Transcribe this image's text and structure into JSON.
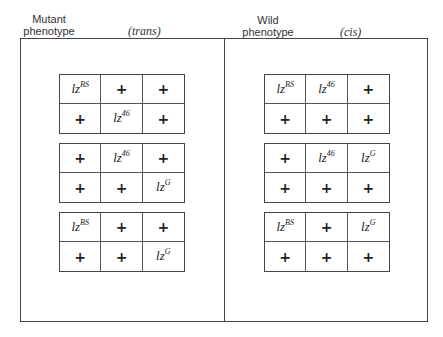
{
  "panels": [
    {
      "label_line1": "Mutant",
      "label_line2": "phenotype",
      "configuration": "(trans)",
      "grids": [
        {
          "rows": [
            [
              {
                "gene": "lz",
                "sup": "BS"
              },
              {
                "gene": "+"
              },
              {
                "gene": "+"
              }
            ],
            [
              {
                "gene": "+"
              },
              {
                "gene": "lz",
                "sup": "46"
              },
              {
                "gene": "+"
              }
            ]
          ]
        },
        {
          "rows": [
            [
              {
                "gene": "+"
              },
              {
                "gene": "lz",
                "sup": "46"
              },
              {
                "gene": "+"
              }
            ],
            [
              {
                "gene": "+"
              },
              {
                "gene": "+"
              },
              {
                "gene": "lz",
                "sup": "G"
              }
            ]
          ]
        },
        {
          "rows": [
            [
              {
                "gene": "lz",
                "sup": "BS"
              },
              {
                "gene": "+"
              },
              {
                "gene": "+"
              }
            ],
            [
              {
                "gene": "+"
              },
              {
                "gene": "+"
              },
              {
                "gene": "lz",
                "sup": "G"
              }
            ]
          ]
        }
      ]
    },
    {
      "label_line1": "Wild",
      "label_line2": "phenotype",
      "configuration": "(cis)",
      "grids": [
        {
          "rows": [
            [
              {
                "gene": "lz",
                "sup": "BS"
              },
              {
                "gene": "lz",
                "sup": "46"
              },
              {
                "gene": "+"
              }
            ],
            [
              {
                "gene": "+"
              },
              {
                "gene": "+"
              },
              {
                "gene": "+"
              }
            ]
          ]
        },
        {
          "rows": [
            [
              {
                "gene": "+"
              },
              {
                "gene": "lz",
                "sup": "46"
              },
              {
                "gene": "lz",
                "sup": "G"
              }
            ],
            [
              {
                "gene": "+"
              },
              {
                "gene": "+"
              },
              {
                "gene": "+"
              }
            ]
          ]
        },
        {
          "rows": [
            [
              {
                "gene": "lz",
                "sup": "BS"
              },
              {
                "gene": "+"
              },
              {
                "gene": "lz",
                "sup": "G"
              }
            ],
            [
              {
                "gene": "+"
              },
              {
                "gene": "+"
              },
              {
                "gene": "+"
              }
            ]
          ]
        }
      ]
    }
  ]
}
